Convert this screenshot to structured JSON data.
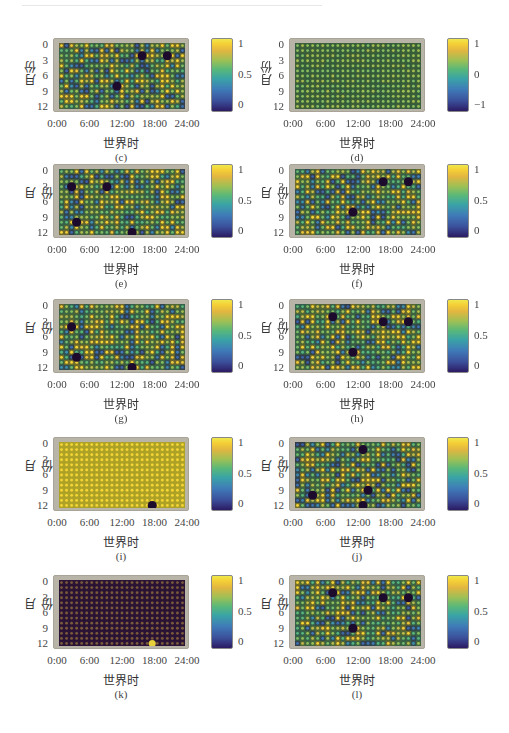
{
  "figure": {
    "ylabel": "月份",
    "xlabel": "世界时",
    "yticks": [
      "0",
      "3",
      "6",
      "9",
      "12"
    ],
    "xticks": [
      "0:00",
      "6:00",
      "12:00",
      "18:00",
      "24:00"
    ]
  },
  "chart_data": [
    {
      "type": "heatmap",
      "panel": "(c)",
      "title": "",
      "xlabel": "世界时",
      "ylabel": "月份",
      "xticks": [
        "0:00",
        "6:00",
        "12:00",
        "18:00",
        "24:00"
      ],
      "yticks": [
        "0",
        "3",
        "6",
        "9",
        "12"
      ],
      "colorbar": {
        "min": 0,
        "max": 1,
        "ticks": [
          "1",
          "0.5",
          "0"
        ]
      },
      "grid": [
        25,
        13
      ],
      "pattern": "mixed",
      "seed": 11,
      "bias": 0.45,
      "spots": [
        [
          16,
          2
        ],
        [
          21,
          2
        ],
        [
          11,
          8
        ]
      ]
    },
    {
      "type": "heatmap",
      "panel": "(d)",
      "title": "",
      "xlabel": "世界时",
      "ylabel": "月份",
      "xticks": [
        "0:00",
        "6:00",
        "12:00",
        "18:00",
        "24:00"
      ],
      "yticks": [
        "0",
        "3",
        "6",
        "9",
        "12"
      ],
      "colorbar": {
        "min": -1,
        "max": 1,
        "ticks": [
          "1",
          "0",
          "−1"
        ]
      },
      "grid": [
        25,
        13
      ],
      "pattern": "uniform-mid",
      "seed": 3,
      "bias": 0.5,
      "spots": []
    },
    {
      "type": "heatmap",
      "panel": "(e)",
      "title": "",
      "xlabel": "世界时",
      "ylabel": "月份",
      "xticks": [
        "0:00",
        "6:00",
        "12:00",
        "18:00",
        "24:00"
      ],
      "yticks": [
        "0",
        "3",
        "6",
        "9",
        "12"
      ],
      "colorbar": {
        "min": 0,
        "max": 1,
        "ticks": [
          "1",
          "0.5",
          "0"
        ]
      },
      "grid": [
        25,
        13
      ],
      "pattern": "mixed",
      "seed": 21,
      "bias": 0.4,
      "spots": [
        [
          2,
          3
        ],
        [
          9,
          3
        ],
        [
          3,
          10
        ],
        [
          14,
          12
        ]
      ]
    },
    {
      "type": "heatmap",
      "panel": "(f)",
      "title": "",
      "xlabel": "世界时",
      "ylabel": "月份",
      "xticks": [
        "0:00",
        "6:00",
        "12:00",
        "18:00",
        "24:00"
      ],
      "yticks": [
        "0",
        "3",
        "6",
        "9",
        "12"
      ],
      "colorbar": {
        "min": 0,
        "max": 1,
        "ticks": [
          "1",
          "0.5",
          "0"
        ]
      },
      "grid": [
        25,
        13
      ],
      "pattern": "mixed",
      "seed": 31,
      "bias": 0.5,
      "spots": [
        [
          17,
          2
        ],
        [
          22,
          2
        ],
        [
          11,
          8
        ]
      ]
    },
    {
      "type": "heatmap",
      "panel": "(g)",
      "title": "",
      "xlabel": "世界时",
      "ylabel": "月份",
      "xticks": [
        "0:00",
        "6:00",
        "12:00",
        "18:00",
        "24:00"
      ],
      "yticks": [
        "0",
        "3",
        "6",
        "9",
        "12"
      ],
      "colorbar": {
        "min": 0,
        "max": 1,
        "ticks": [
          "1",
          "0.5",
          "0"
        ]
      },
      "grid": [
        25,
        13
      ],
      "pattern": "mixed",
      "seed": 41,
      "bias": 0.4,
      "spots": [
        [
          2,
          4
        ],
        [
          3,
          10
        ],
        [
          14,
          12
        ]
      ]
    },
    {
      "type": "heatmap",
      "panel": "(h)",
      "title": "",
      "xlabel": "世界时",
      "ylabel": "月份",
      "xticks": [
        "0:00",
        "6:00",
        "12:00",
        "18:00",
        "24:00"
      ],
      "yticks": [
        "0",
        "3",
        "6",
        "9",
        "12"
      ],
      "colorbar": {
        "min": 0,
        "max": 1,
        "ticks": [
          "1",
          "0.5",
          "0"
        ]
      },
      "grid": [
        25,
        13
      ],
      "pattern": "mixed",
      "seed": 51,
      "bias": 0.38,
      "spots": [
        [
          7,
          2
        ],
        [
          17,
          3
        ],
        [
          22,
          3
        ],
        [
          11,
          9
        ]
      ]
    },
    {
      "type": "heatmap",
      "panel": "(i)",
      "title": "",
      "xlabel": "世界时",
      "ylabel": "月份",
      "xticks": [
        "0:00",
        "6:00",
        "12:00",
        "18:00",
        "24:00"
      ],
      "yticks": [
        "0",
        "3",
        "6",
        "9",
        "12"
      ],
      "colorbar": {
        "min": 0,
        "max": 1,
        "ticks": [
          "1",
          "0.5",
          "0"
        ]
      },
      "grid": [
        25,
        13
      ],
      "pattern": "all-high",
      "seed": 61,
      "bias": 1,
      "spots": [
        [
          18,
          12
        ]
      ]
    },
    {
      "type": "heatmap",
      "panel": "(j)",
      "title": "",
      "xlabel": "世界时",
      "ylabel": "月份",
      "xticks": [
        "0:00",
        "6:00",
        "12:00",
        "18:00",
        "24:00"
      ],
      "yticks": [
        "0",
        "3",
        "6",
        "9",
        "12"
      ],
      "colorbar": {
        "min": 0,
        "max": 1,
        "ticks": [
          "1",
          "0.5",
          "0"
        ]
      },
      "grid": [
        25,
        13
      ],
      "pattern": "mixed",
      "seed": 71,
      "bias": 0.42,
      "spots": [
        [
          13,
          1
        ],
        [
          14,
          9
        ],
        [
          3,
          10
        ],
        [
          13,
          12
        ]
      ]
    },
    {
      "type": "heatmap",
      "panel": "(k)",
      "title": "",
      "xlabel": "世界时",
      "ylabel": "月份",
      "xticks": [
        "0:00",
        "6:00",
        "12:00",
        "18:00",
        "24:00"
      ],
      "yticks": [
        "0",
        "3",
        "6",
        "9",
        "12"
      ],
      "colorbar": {
        "min": 0,
        "max": 1,
        "ticks": [
          "1",
          "0.5",
          "0"
        ]
      },
      "grid": [
        25,
        13
      ],
      "pattern": "all-low",
      "seed": 81,
      "bias": 0,
      "spots": [],
      "bright_spots": [
        [
          18,
          12
        ]
      ]
    },
    {
      "type": "heatmap",
      "panel": "(l)",
      "title": "",
      "xlabel": "世界时",
      "ylabel": "月份",
      "xticks": [
        "0:00",
        "6:00",
        "12:00",
        "18:00",
        "24:00"
      ],
      "yticks": [
        "0",
        "3",
        "6",
        "9",
        "12"
      ],
      "colorbar": {
        "min": 0,
        "max": 1,
        "ticks": [
          "1",
          "0.5",
          "0"
        ]
      },
      "grid": [
        25,
        13
      ],
      "pattern": "mixed",
      "seed": 91,
      "bias": 0.38,
      "spots": [
        [
          7,
          2
        ],
        [
          17,
          3
        ],
        [
          22,
          3
        ],
        [
          11,
          9
        ]
      ]
    }
  ],
  "panels": [
    {
      "caption": "(c)",
      "cbar": [
        "1",
        "0.5",
        "0"
      ]
    },
    {
      "caption": "(d)",
      "cbar": [
        "1",
        "0",
        "−1"
      ]
    },
    {
      "caption": "(e)",
      "cbar": [
        "1",
        "0.5",
        "0"
      ]
    },
    {
      "caption": "(f)",
      "cbar": [
        "1",
        "0.5",
        "0"
      ]
    },
    {
      "caption": "(g)",
      "cbar": [
        "1",
        "0.5",
        "0"
      ]
    },
    {
      "caption": "(h)",
      "cbar": [
        "1",
        "0.5",
        "0"
      ]
    },
    {
      "caption": "(i)",
      "cbar": [
        "1",
        "0.5",
        "0"
      ]
    },
    {
      "caption": "(j)",
      "cbar": [
        "1",
        "0.5",
        "0"
      ]
    },
    {
      "caption": "(k)",
      "cbar": [
        "1",
        "0.5",
        "0"
      ]
    },
    {
      "caption": "(l)",
      "cbar": [
        "1",
        "0.5",
        "0"
      ]
    }
  ]
}
